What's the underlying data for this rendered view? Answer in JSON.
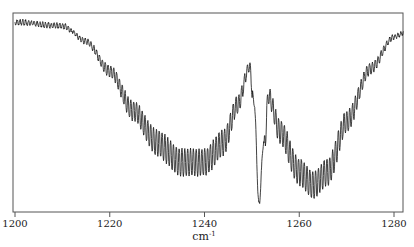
{
  "chart_data": {
    "type": "line",
    "title": "",
    "xlabel": "cm",
    "xlabel_superscript": "-1",
    "ylabel": "",
    "xlim": [
      1200,
      1282
    ],
    "x_ticks": [
      1200,
      1220,
      1240,
      1260,
      1280
    ],
    "x_tick_labels": [
      "1200",
      "1220",
      "1240",
      "1260",
      "1280"
    ],
    "y_ticks": [],
    "grid": false,
    "legend": null,
    "envelope_points": [
      {
        "x": 1200,
        "y": 0.98
      },
      {
        "x": 1210,
        "y": 0.96
      },
      {
        "x": 1215,
        "y": 0.88
      },
      {
        "x": 1220,
        "y": 0.74
      },
      {
        "x": 1225,
        "y": 0.55
      },
      {
        "x": 1230,
        "y": 0.4
      },
      {
        "x": 1235,
        "y": 0.3
      },
      {
        "x": 1240,
        "y": 0.3
      },
      {
        "x": 1244,
        "y": 0.4
      },
      {
        "x": 1247,
        "y": 0.58
      },
      {
        "x": 1249.5,
        "y": 0.76
      },
      {
        "x": 1250.5,
        "y": 0.55
      },
      {
        "x": 1251.5,
        "y": 0.02
      },
      {
        "x": 1252.5,
        "y": 0.35
      },
      {
        "x": 1253.5,
        "y": 0.62
      },
      {
        "x": 1256,
        "y": 0.45
      },
      {
        "x": 1260,
        "y": 0.25
      },
      {
        "x": 1263,
        "y": 0.18
      },
      {
        "x": 1266,
        "y": 0.25
      },
      {
        "x": 1270,
        "y": 0.5
      },
      {
        "x": 1275,
        "y": 0.75
      },
      {
        "x": 1280,
        "y": 0.9
      },
      {
        "x": 1282,
        "y": 0.92
      }
    ],
    "fine_structure": {
      "line_spacing_cm-1": 0.6,
      "max_amplitude": 0.14
    }
  },
  "style": {
    "line_color": "#111111",
    "frame_color": "#555555"
  }
}
